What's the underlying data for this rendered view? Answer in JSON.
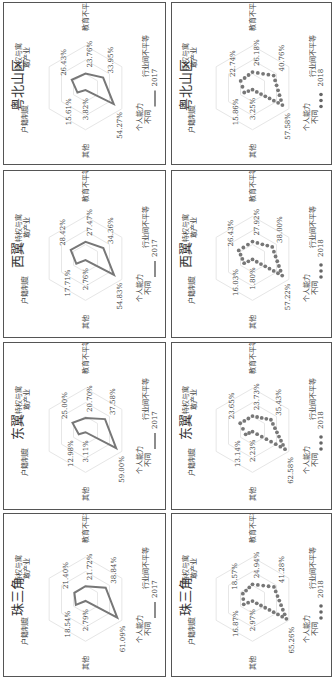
{
  "page": {
    "rotation_deg": -90,
    "note_visible": false
  },
  "axes": [
    "户籍制度",
    "特权与寓敢产业",
    "教育不平等",
    "行业间不平等",
    "个人能力不同",
    "其他"
  ],
  "axis_labels": {
    "hukou": "户籍制度",
    "privilege_line1": "特权与寓",
    "privilege_line2": "敢产业",
    "education": "教育不平等",
    "industry": "行业间不平等",
    "ability_line1": "个人能力",
    "ability_line2": "不同",
    "other": "其他"
  },
  "panels": [
    {
      "region": "粤北山区",
      "year": "2017",
      "legend": "2017",
      "style": "line",
      "values": {
        "hukou": "15.61%",
        "privilege": "26.43%",
        "education": "23.76%",
        "industry": "33.95%",
        "ability": "54.27%",
        "other": "3.82%"
      }
    },
    {
      "region": "粤北山区",
      "year": "2018",
      "legend": "2018",
      "style": "dots",
      "values": {
        "hukou": "15.86%",
        "privilege": "22.74%",
        "education": "26.18%",
        "industry": "40.76%",
        "ability": "57.58%",
        "other": "3.25%"
      }
    },
    {
      "region": "西翼",
      "year": "2017",
      "legend": "2017",
      "style": "line",
      "values": {
        "hukou": "17.71%",
        "privilege": "28.42%",
        "education": "27.47%",
        "industry": "34.36%",
        "ability": "54.83%",
        "other": "2.76%"
      }
    },
    {
      "region": "西翼",
      "year": "2018",
      "legend": "2018",
      "style": "dots",
      "values": {
        "hukou": "16.03%",
        "privilege": "26.43%",
        "education": "27.92%",
        "industry": "38.00%",
        "ability": "57.22%",
        "other": "1.80%"
      }
    },
    {
      "region": "东翼",
      "year": "2017",
      "legend": "2017",
      "style": "line",
      "values": {
        "hukou": "12.98%",
        "privilege": "25.00%",
        "education": "20.70%",
        "industry": "37.58%",
        "ability": "59.00%",
        "other": "3.11%"
      }
    },
    {
      "region": "东翼",
      "year": "2018",
      "legend": "2018",
      "style": "dots",
      "values": {
        "hukou": "13.14%",
        "privilege": "23.65%",
        "education": "23.73%",
        "industry": "35.43%",
        "ability": "62.58%",
        "other": "2.23%"
      }
    },
    {
      "region": "珠三角",
      "year": "2017",
      "legend": "2017",
      "style": "line",
      "values": {
        "hukou": "18.54%",
        "privilege": "21.40%",
        "education": "21.72%",
        "industry": "38.84%",
        "ability": "61.09%",
        "other": "2.79%"
      }
    },
    {
      "region": "珠三角",
      "year": "2018",
      "legend": "2018",
      "style": "dots",
      "values": {
        "hukou": "16.87%",
        "privilege": "18.57%",
        "education": "24.94%",
        "industry": "41.28%",
        "ability": "65.26%",
        "other": "2.97%"
      }
    }
  ],
  "chart_data": [
    {
      "type": "radar",
      "title": "粤北山区",
      "legend": [
        "2017"
      ],
      "categories": [
        "户籍制度",
        "特权与寓敢产业",
        "教育不平等",
        "行业间不平等",
        "个人能力不同",
        "其他"
      ],
      "series": [
        {
          "name": "2017",
          "values": [
            15.61,
            26.43,
            23.76,
            33.95,
            54.27,
            3.82
          ]
        }
      ],
      "unit": "%"
    },
    {
      "type": "radar",
      "title": "粤北山区",
      "legend": [
        "2018"
      ],
      "categories": [
        "户籍制度",
        "特权与寓敢产业",
        "教育不平等",
        "行业间不平等",
        "个人能力不同",
        "其他"
      ],
      "series": [
        {
          "name": "2018",
          "values": [
            15.86,
            22.74,
            26.18,
            40.76,
            57.58,
            3.25
          ]
        }
      ],
      "unit": "%"
    },
    {
      "type": "radar",
      "title": "西翼",
      "legend": [
        "2017"
      ],
      "categories": [
        "户籍制度",
        "特权与寓敢产业",
        "教育不平等",
        "行业间不平等",
        "个人能力不同",
        "其他"
      ],
      "series": [
        {
          "name": "2017",
          "values": [
            17.71,
            28.42,
            27.47,
            34.36,
            54.83,
            2.76
          ]
        }
      ],
      "unit": "%"
    },
    {
      "type": "radar",
      "title": "西翼",
      "legend": [
        "2018"
      ],
      "categories": [
        "户籍制度",
        "特权与寓敢产业",
        "教育不平等",
        "行业间不平等",
        "个人能力不同",
        "其他"
      ],
      "series": [
        {
          "name": "2018",
          "values": [
            16.03,
            26.43,
            27.92,
            38.0,
            57.22,
            1.8
          ]
        }
      ],
      "unit": "%"
    },
    {
      "type": "radar",
      "title": "东翼",
      "legend": [
        "2017"
      ],
      "categories": [
        "户籍制度",
        "特权与寓敢产业",
        "教育不平等",
        "行业间不平等",
        "个人能力不同",
        "其他"
      ],
      "series": [
        {
          "name": "2017",
          "values": [
            12.98,
            25.0,
            20.7,
            37.58,
            59.0,
            3.11
          ]
        }
      ],
      "unit": "%"
    },
    {
      "type": "radar",
      "title": "东翼",
      "legend": [
        "2018"
      ],
      "categories": [
        "户籍制度",
        "特权与寓敢产业",
        "教育不平等",
        "行业间不平等",
        "个人能力不同",
        "其他"
      ],
      "series": [
        {
          "name": "2018",
          "values": [
            13.14,
            23.65,
            23.73,
            35.43,
            62.58,
            2.23
          ]
        }
      ],
      "unit": "%"
    },
    {
      "type": "radar",
      "title": "珠三角",
      "legend": [
        "2017"
      ],
      "categories": [
        "户籍制度",
        "特权与寓敢产业",
        "教育不平等",
        "行业间不平等",
        "个人能力不同",
        "其他"
      ],
      "series": [
        {
          "name": "2017",
          "values": [
            18.54,
            21.4,
            21.72,
            38.84,
            61.09,
            2.79
          ]
        }
      ],
      "unit": "%"
    },
    {
      "type": "radar",
      "title": "珠三角",
      "legend": [
        "2018"
      ],
      "categories": [
        "户籍制度",
        "特权与寓敢产业",
        "教育不平等",
        "行业间不平等",
        "个人能力不同",
        "其他"
      ],
      "series": [
        {
          "name": "2018",
          "values": [
            16.87,
            18.57,
            24.94,
            41.28,
            65.26,
            2.97
          ]
        }
      ],
      "unit": "%"
    }
  ]
}
